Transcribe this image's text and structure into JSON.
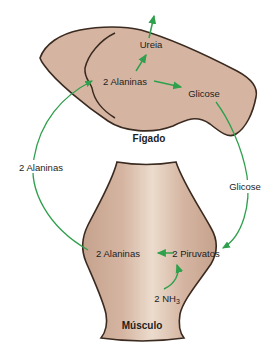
{
  "diagram": {
    "liver": {
      "label": "Fígado",
      "urea": "Ureia",
      "alanines": "2 Alaninas",
      "glucose": "Glicose"
    },
    "muscle": {
      "label": "Músculo",
      "alanines": "2 Alaninas",
      "pyruvates": "2 Piruvatos",
      "ammonia_base": "2 NH",
      "ammonia_sub": "3"
    },
    "cycle": {
      "alanine_transport_label": "2 Alaninas",
      "glucose_transport_label": "Glicose"
    }
  },
  "colors": {
    "background": "#ffffff",
    "organ_fill": "#d5b5a2",
    "organ_fill_light": "#ecdccd",
    "organ_fill_dark": "#c5a28c",
    "outline": "#3b2a20",
    "arrow": "#2fa04c",
    "text": "#1d1d1d"
  }
}
